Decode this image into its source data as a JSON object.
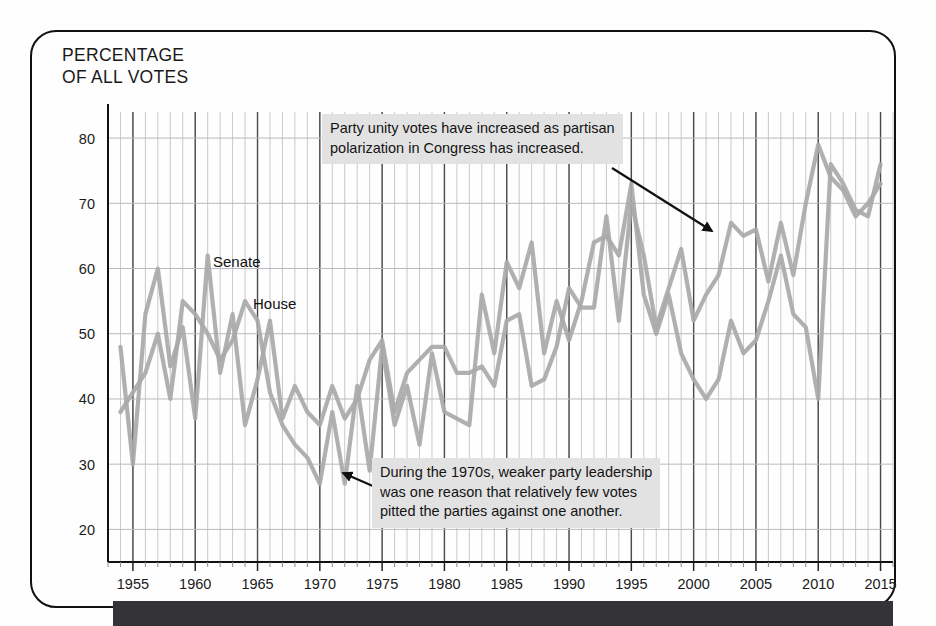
{
  "page": {
    "background_color": "#fefefe",
    "card_border_color": "#111111",
    "dark_bar_color": "#333338"
  },
  "chart_title": "PERCENTAGE\nOF ALL VOTES",
  "annotations": [
    {
      "id": "top",
      "text": "Party unity votes have increased as partisan\npolarization in Congress has increased.",
      "arrow_from": [
        612,
        168
      ],
      "arrow_to": [
        712,
        231
      ]
    },
    {
      "id": "bottom",
      "text": "During the 1970s, weaker party leadership\nwas one reason that relatively few votes\npitted the parties against one another.",
      "arrow_from": [
        398,
        497
      ],
      "arrow_to": [
        343,
        473
      ]
    }
  ],
  "series_labels": {
    "senate": "Senate",
    "house": "House"
  },
  "chart_data": {
    "type": "line",
    "title": "PERCENTAGE OF ALL VOTES",
    "xlabel": "",
    "ylabel": "PERCENTAGE OF ALL VOTES",
    "xlim": [
      1953,
      2016
    ],
    "ylim": [
      15,
      84
    ],
    "grid": true,
    "grid_minor_x_step": 1,
    "grid_major_x_step": 5,
    "legend": "inline-labels",
    "line_color": "#a9a9a9",
    "x_tick_labels": [
      "1955",
      "1960",
      "1965",
      "1970",
      "1975",
      "1980",
      "1985",
      "1990",
      "1995",
      "2000",
      "2005",
      "2010",
      "2015"
    ],
    "x_tick_values": [
      1955,
      1960,
      1965,
      1970,
      1975,
      1980,
      1985,
      1990,
      1995,
      2000,
      2005,
      2010,
      2015
    ],
    "y_tick_labels": [
      "20",
      "30",
      "40",
      "50",
      "60",
      "70",
      "80"
    ],
    "y_tick_values": [
      20,
      30,
      40,
      50,
      60,
      70,
      80
    ],
    "x": [
      1954,
      1955,
      1956,
      1957,
      1958,
      1959,
      1960,
      1961,
      1962,
      1963,
      1964,
      1965,
      1966,
      1967,
      1968,
      1969,
      1970,
      1971,
      1972,
      1973,
      1974,
      1975,
      1976,
      1977,
      1978,
      1979,
      1980,
      1981,
      1982,
      1983,
      1984,
      1985,
      1986,
      1987,
      1988,
      1989,
      1990,
      1991,
      1992,
      1993,
      1994,
      1995,
      1996,
      1997,
      1998,
      1999,
      2000,
      2001,
      2002,
      2003,
      2004,
      2005,
      2006,
      2007,
      2008,
      2009,
      2010,
      2011,
      2012,
      2013,
      2014,
      2015
    ],
    "series": [
      {
        "name": "Senate",
        "color": "#a9a9a9",
        "values": [
          48,
          30,
          53,
          60,
          45,
          51,
          37,
          62,
          44,
          53,
          36,
          43,
          52,
          37,
          42,
          38,
          36,
          42,
          37,
          40,
          46,
          49,
          38,
          44,
          46,
          48,
          48,
          44,
          44,
          45,
          42,
          52,
          53,
          42,
          43,
          48,
          57,
          54,
          54,
          68,
          52,
          70,
          62,
          51,
          57,
          63,
          52,
          56,
          59,
          67,
          65,
          66,
          58,
          67,
          59,
          70,
          79,
          74,
          72,
          68,
          70,
          73
        ]
      },
      {
        "name": "House",
        "color": "#a9a9a9",
        "values": [
          38,
          41,
          44,
          50,
          40,
          55,
          53,
          50,
          46,
          49,
          55,
          52,
          41,
          36,
          33,
          31,
          27,
          38,
          27,
          42,
          29,
          48,
          36,
          42,
          33,
          47,
          38,
          37,
          36,
          56,
          47,
          61,
          57,
          64,
          47,
          55,
          49,
          55,
          64,
          65,
          62,
          73,
          56,
          50,
          56,
          47,
          43,
          40,
          43,
          52,
          47,
          49,
          55,
          62,
          53,
          51,
          40,
          76,
          73,
          69,
          68,
          76
        ]
      }
    ]
  }
}
